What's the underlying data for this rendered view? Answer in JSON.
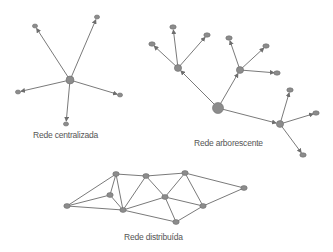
{
  "colors": {
    "edge": "#7a7a7a",
    "node": "#8c8c8c",
    "text": "#555555",
    "background": "#ffffff"
  },
  "labels": {
    "centralized": "Rede centralizada",
    "tree": "Rede arborescente",
    "distributed": "Rede distribuída"
  },
  "networks": {
    "centralized": {
      "hub": [
        70,
        80
      ],
      "leaves": [
        [
          35,
          26
        ],
        [
          97,
          17
        ],
        [
          18,
          92
        ],
        [
          120,
          95
        ],
        [
          66,
          124
        ]
      ]
    },
    "tree": {
      "root": [
        218,
        108
      ],
      "branches": [
        {
          "node": [
            178,
            68
          ],
          "leaves": [
            [
              152,
              44
            ],
            [
              173,
              27
            ],
            [
              207,
              35
            ]
          ]
        },
        {
          "node": [
            240,
            70
          ],
          "leaves": [
            [
              229,
              38
            ],
            [
              266,
              46
            ],
            [
              277,
              73
            ]
          ]
        },
        {
          "node": [
            280,
            124
          ],
          "leaves": [
            [
              290,
              90
            ],
            [
              316,
              113
            ],
            [
              303,
              155
            ]
          ]
        }
      ]
    },
    "distributed": {
      "nodes": {
        "A": [
          67,
          206
        ],
        "B": [
          116,
          174
        ],
        "C": [
          146,
          176
        ],
        "D": [
          185,
          173
        ],
        "E": [
          244,
          188
        ],
        "F": [
          110,
          195
        ],
        "G": [
          123,
          210
        ],
        "H": [
          165,
          197
        ],
        "I": [
          203,
          206
        ],
        "J": [
          176,
          222
        ]
      },
      "edges": [
        [
          "A",
          "B"
        ],
        [
          "A",
          "F"
        ],
        [
          "A",
          "G"
        ],
        [
          "B",
          "F"
        ],
        [
          "B",
          "G"
        ],
        [
          "B",
          "C"
        ],
        [
          "C",
          "D"
        ],
        [
          "C",
          "G"
        ],
        [
          "C",
          "H"
        ],
        [
          "D",
          "H"
        ],
        [
          "D",
          "I"
        ],
        [
          "D",
          "E"
        ],
        [
          "E",
          "I"
        ],
        [
          "F",
          "G"
        ],
        [
          "G",
          "H"
        ],
        [
          "G",
          "J"
        ],
        [
          "H",
          "I"
        ],
        [
          "H",
          "J"
        ],
        [
          "I",
          "J"
        ]
      ]
    }
  }
}
